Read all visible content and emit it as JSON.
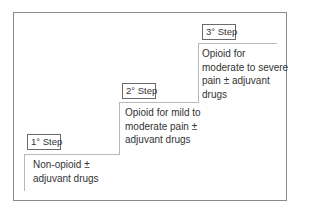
{
  "diagram": {
    "type": "staircase",
    "steps": [
      {
        "label": "1° Step",
        "description": [
          "Non-opioid ±",
          "adjuvant drugs"
        ]
      },
      {
        "label": "2° Step",
        "description": [
          "Opioid for mild to",
          "moderate pain ±",
          "adjuvant drugs"
        ]
      },
      {
        "label": "3° Step",
        "description": [
          "Opioid for",
          "moderate to severe",
          "pain ± adjuvant",
          "drugs"
        ]
      }
    ]
  }
}
